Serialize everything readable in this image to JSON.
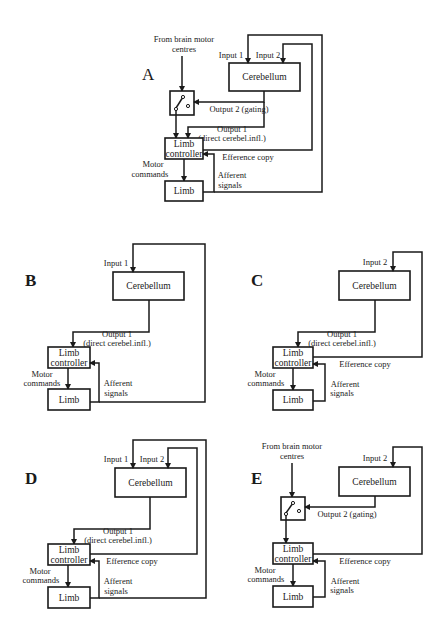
{
  "figure": {
    "panels": [
      {
        "id": "A",
        "label": "A",
        "cerebellum": "Cerebellum",
        "limb_controller": [
          "Limb",
          "controller"
        ],
        "limb": "Limb",
        "from_brain": [
          "From brain motor",
          "centres"
        ],
        "input1": "Input 1",
        "input2": "Input 2",
        "output2": "Output 2 (gating)",
        "output1": [
          "Output 1",
          "(direct cerebel.infl.)"
        ],
        "efference": "Efference copy",
        "motor": [
          "Motor",
          "commands"
        ],
        "afferent": [
          "Afferent",
          "signals"
        ]
      },
      {
        "id": "B",
        "label": "B",
        "cerebellum": "Cerebellum",
        "limb_controller": [
          "Limb",
          "controller"
        ],
        "limb": "Limb",
        "input1": "Input 1",
        "output1": [
          "Output 1",
          "(direct cerebel.infl.)"
        ],
        "motor": [
          "Motor",
          "commands"
        ],
        "afferent": [
          "Afferent",
          "signals"
        ]
      },
      {
        "id": "C",
        "label": "C",
        "cerebellum": "Cerebellum",
        "limb_controller": [
          "Limb",
          "controller"
        ],
        "limb": "Limb",
        "input2": "Input 2",
        "output1": [
          "Output 1",
          "(direct cerebel.infl.)"
        ],
        "efference": "Efference copy",
        "motor": [
          "Motor",
          "commands"
        ],
        "afferent": [
          "Afferent",
          "signals"
        ]
      },
      {
        "id": "D",
        "label": "D",
        "cerebellum": "Cerebellum",
        "limb_controller": [
          "Limb",
          "controller"
        ],
        "limb": "Limb",
        "input1": "Input 1",
        "input2": "Input 2",
        "output1": [
          "Output 1",
          "(direct cerebel.infl.)"
        ],
        "efference": "Efference copy",
        "motor": [
          "Motor",
          "commands"
        ],
        "afferent": [
          "Afferent",
          "signals"
        ]
      },
      {
        "id": "E",
        "label": "E",
        "cerebellum": "Cerebellum",
        "limb_controller": [
          "Limb",
          "controller"
        ],
        "limb": "Limb",
        "from_brain": [
          "From brain motor",
          "centres"
        ],
        "input2": "Input 2",
        "output2": "Output 2 (gating)",
        "efference": "Efference copy",
        "motor": [
          "Motor",
          "commands"
        ],
        "afferent": [
          "Afferent",
          "signals"
        ]
      }
    ]
  }
}
